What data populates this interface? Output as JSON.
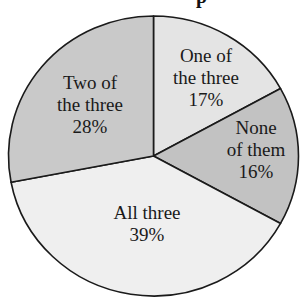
{
  "chart_data": {
    "type": "pie",
    "title": "",
    "title_fragment_visible": "p",
    "start_angle_deg": 0,
    "direction": "clockwise",
    "slices": [
      {
        "label": "One of the three",
        "label_lines": [
          "One of",
          "the three"
        ],
        "value": 17,
        "value_label": "17%",
        "color": "#e4e4e4"
      },
      {
        "label": "None of them",
        "label_lines": [
          "None",
          "of them"
        ],
        "value": 16,
        "value_label": "16%",
        "color": "#c2c2c2"
      },
      {
        "label": "All three",
        "label_lines": [
          "All three"
        ],
        "value": 39,
        "value_label": "39%",
        "color": "#efefef"
      },
      {
        "label": "Two of the three",
        "label_lines": [
          "Two of",
          "the three"
        ],
        "value": 28,
        "value_label": "28%",
        "color": "#c9c9c9"
      }
    ],
    "categories": [
      "One of the three",
      "None of them",
      "All three",
      "Two of the three"
    ],
    "values": [
      17,
      16,
      39,
      28
    ],
    "units": "%",
    "legend": "none (labels inside slices)",
    "stroke_color": "#1a1a1a"
  },
  "labels": {
    "one": {
      "line1": "One of",
      "line2": "the three",
      "pct": "17%"
    },
    "none": {
      "line1": "None",
      "line2": "of them",
      "pct": "16%"
    },
    "all": {
      "line1": "All three",
      "pct": "39%"
    },
    "two": {
      "line1": "Two of",
      "line2": "the three",
      "pct": "28%"
    }
  },
  "title_fragment": "p"
}
